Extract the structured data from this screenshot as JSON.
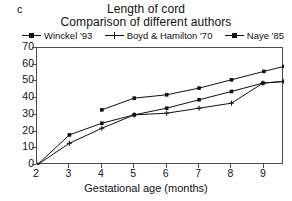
{
  "panel": {
    "letter": "c"
  },
  "titles": {
    "main": "Length of cord",
    "sub": "Comparison of different authors"
  },
  "legend": {
    "position": "top",
    "items": [
      {
        "label": "Winckel '93",
        "marker": "square",
        "color": "#111111"
      },
      {
        "label": "Boyd & Hamilton '70",
        "marker": "cross",
        "color": "#111111"
      },
      {
        "label": "Naye '85",
        "marker": "square",
        "color": "#111111"
      }
    ]
  },
  "axes": {
    "x": {
      "label": "Gestational age (months)",
      "ticks": [
        2,
        3,
        4,
        5,
        6,
        7,
        8,
        9
      ],
      "min": 2,
      "max": 9.62
    },
    "y": {
      "label": "",
      "ticks": [
        0,
        10,
        20,
        30,
        40,
        50,
        60,
        70
      ],
      "min": 0,
      "max": 70
    },
    "grid": false
  },
  "chart_data": {
    "type": "line",
    "title": "Length of cord",
    "subtitle": "Comparison of different authors",
    "xlabel": "Gestational age (months)",
    "ylabel": "",
    "xlim": [
      2,
      9.62
    ],
    "ylim": [
      0,
      70
    ],
    "xticks": [
      2,
      3,
      4,
      5,
      6,
      7,
      8,
      9
    ],
    "yticks": [
      0,
      10,
      20,
      30,
      40,
      50,
      60,
      70
    ],
    "grid": false,
    "legend_position": "top",
    "series": [
      {
        "name": "Winckel '93",
        "marker": "square",
        "color": "#111111",
        "points": [
          {
            "x": 2,
            "y": 0
          },
          {
            "x": 3,
            "y": 18
          },
          {
            "x": 4,
            "y": 25
          },
          {
            "x": 5,
            "y": 30
          },
          {
            "x": 6,
            "y": 34
          },
          {
            "x": 7,
            "y": 39
          },
          {
            "x": 8,
            "y": 44
          },
          {
            "x": 8.97,
            "y": 49
          },
          {
            "x": 9.62,
            "y": 50
          }
        ]
      },
      {
        "name": "Boyd & Hamilton '70",
        "marker": "cross",
        "color": "#111111",
        "points": [
          {
            "x": 2,
            "y": 0
          },
          {
            "x": 3,
            "y": 13
          },
          {
            "x": 4,
            "y": 22
          },
          {
            "x": 5,
            "y": 30
          },
          {
            "x": 6,
            "y": 31
          },
          {
            "x": 7,
            "y": 34
          },
          {
            "x": 8,
            "y": 37
          },
          {
            "x": 8.97,
            "y": 49
          },
          {
            "x": 9.62,
            "y": 50
          }
        ]
      },
      {
        "name": "Naye '85",
        "marker": "square",
        "color": "#111111",
        "points": [
          {
            "x": 4,
            "y": 33
          },
          {
            "x": 5,
            "y": 40
          },
          {
            "x": 6,
            "y": 42
          },
          {
            "x": 7,
            "y": 46
          },
          {
            "x": 8,
            "y": 51
          },
          {
            "x": 9,
            "y": 56
          },
          {
            "x": 9.62,
            "y": 59
          }
        ]
      }
    ]
  }
}
